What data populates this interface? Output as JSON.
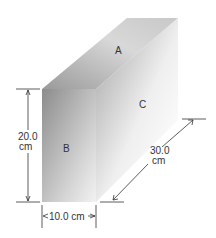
{
  "diagram": {
    "faces": {
      "top": "A",
      "front": "B",
      "side": "C"
    },
    "dimensions": {
      "height_value": "20.0",
      "height_unit": "cm",
      "width": "10.0 cm",
      "depth_value": "30.0",
      "depth_unit": "cm"
    },
    "colors": {
      "face_dark": "#8a8a8a",
      "face_light": "#ffffff",
      "line": "#333333"
    }
  }
}
